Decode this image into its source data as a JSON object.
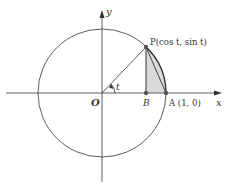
{
  "diagram": {
    "type": "unit-circle",
    "colors": {
      "stroke": "#333333",
      "shade": "#d9d9d9",
      "point": "#555555",
      "background": "#ffffff"
    },
    "axes": {
      "x_label": "x",
      "y_label": "y"
    },
    "labels": {
      "origin": "O",
      "point_p": "P(cos t, sin t)",
      "point_b": "B",
      "point_a": "A (1, 0)",
      "angle": "t"
    }
  }
}
